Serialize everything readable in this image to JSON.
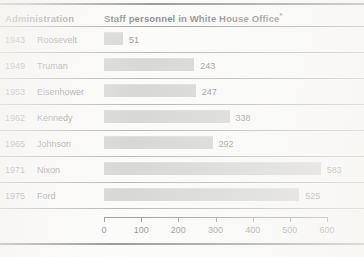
{
  "table": {
    "header": {
      "col_administration": "Administration",
      "col_staff": "Staff personnel in White House Office",
      "col_staff_superscript": "*"
    }
  },
  "chart_data": {
    "type": "bar",
    "orientation": "horizontal",
    "title": "Staff personnel in White House Office*",
    "xlabel": "",
    "ylabel": "Administration",
    "xlim": [
      0,
      600
    ],
    "grid": false,
    "legend": null,
    "axis_ticks": [
      0,
      100,
      200,
      300,
      400,
      500,
      600
    ],
    "categories": [
      "1943 Roosevelt",
      "1949 Truman",
      "1953 Eisenhower",
      "1962 Kennedy",
      "1965 Johnson",
      "1971 Nixon",
      "1975 Ford"
    ],
    "values": [
      51,
      243,
      247,
      338,
      292,
      583,
      525
    ],
    "rows": [
      {
        "year": "1943",
        "name": "Roosevelt",
        "value": 51,
        "value_label": "51"
      },
      {
        "year": "1949",
        "name": "Truman",
        "value": 243,
        "value_label": "243"
      },
      {
        "year": "1953",
        "name": "Eisenhower",
        "value": 247,
        "value_label": "247"
      },
      {
        "year": "1962",
        "name": "Kennedy",
        "value": 338,
        "value_label": "338"
      },
      {
        "year": "1965",
        "name": "Johnson",
        "value": 292,
        "value_label": "292"
      },
      {
        "year": "1971",
        "name": "Nixon",
        "value": 583,
        "value_label": "583"
      },
      {
        "year": "1975",
        "name": "Ford",
        "value": 525,
        "value_label": "525"
      }
    ],
    "colors": {
      "bar_fill": "#b2b2b2",
      "rule": "#3a3a3a",
      "text": "#1f1f1f"
    }
  }
}
